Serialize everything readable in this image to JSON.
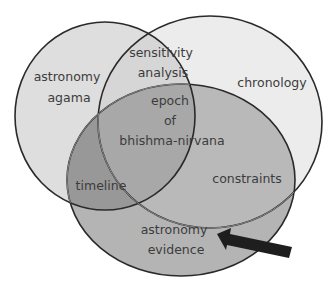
{
  "diagram": {
    "type": "venn",
    "sets": [
      {
        "id": "left",
        "label_lines": [
          "astronomy",
          "agama"
        ],
        "fill": "#dedede"
      },
      {
        "id": "right",
        "label_lines": [
          "chronology"
        ],
        "fill": "#ececec"
      },
      {
        "id": "bottom",
        "label_lines": [
          "astronomy",
          "evidence"
        ],
        "fill": "#b4b4b4"
      }
    ],
    "intersections": {
      "left_right": [
        "sensitivity",
        "analysis"
      ],
      "left_bottom": [
        "timeline"
      ],
      "right_bottom": [
        "constraints"
      ],
      "all": [
        "epoch",
        "of",
        "bhishma-nirvana"
      ]
    },
    "colors": {
      "outline": "#2a2a2a",
      "text": "#3c3c3c",
      "arrow": "#1e1e1e",
      "left_bottom_fill": "#989898",
      "center_fill": "#a8a8a8"
    },
    "annotation": {
      "type": "arrow",
      "points_to": "bottom"
    }
  }
}
